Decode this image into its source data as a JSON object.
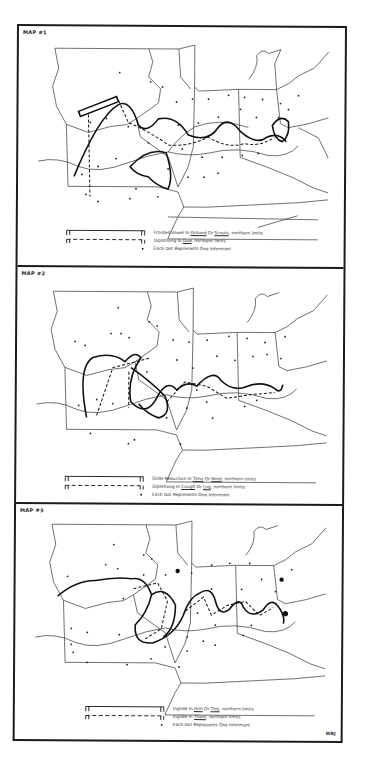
{
  "document": {
    "type": "dialect-atlas-figure",
    "signature": "WBJ"
  },
  "maps": [
    {
      "label": "MAP #1",
      "legend": [
        {
          "symbol": "solid-line",
          "text_parts": [
            "Fronted Vowel In ",
            "Ground",
            " Or ",
            "Scouts",
            ", northern limits"
          ],
          "underlined": [
            1,
            3
          ]
        },
        {
          "symbol": "dashed-line",
          "text_parts": [
            "Diphthong In ",
            "Due",
            ", northern limits"
          ],
          "underlined": [
            1
          ]
        },
        {
          "symbol": "dot",
          "text_parts": [
            "Each Dot Represents One Informant"
          ],
          "underlined": []
        }
      ]
    },
    {
      "label": "MAP #2",
      "legend": [
        {
          "symbol": "solid-line",
          "text_parts": [
            "Glide Reduction In ",
            "Time",
            " Or ",
            "Mind",
            ", northern limits"
          ],
          "underlined": [
            1,
            3
          ]
        },
        {
          "symbol": "dashed-line",
          "text_parts": [
            "Diphthong In ",
            "Cough",
            " Or ",
            "Log",
            ", northern limits"
          ],
          "underlined": [
            1,
            3
          ]
        },
        {
          "symbol": "dot",
          "text_parts": [
            "Each Dot Represents One Informant"
          ],
          "underlined": []
        }
      ]
    },
    {
      "label": "MAP #3",
      "legend": [
        {
          "symbol": "solid-line",
          "text_parts": [
            "Inglide In ",
            "Him",
            " Or ",
            "This",
            ", northern limits"
          ],
          "underlined": [
            1,
            3
          ]
        },
        {
          "symbol": "dashed-line",
          "text_parts": [
            "Inglide In ",
            "Them",
            ", northern limits"
          ],
          "underlined": [
            1
          ]
        },
        {
          "symbol": "dot",
          "text_parts": [
            "Each Dot Represents One Informant"
          ],
          "underlined": []
        }
      ]
    }
  ]
}
